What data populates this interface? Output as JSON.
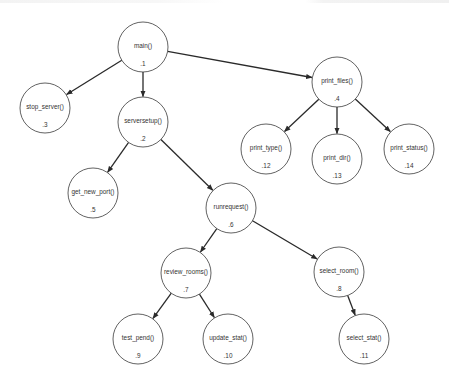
{
  "diagram": {
    "type": "call-tree",
    "node_radius": 25,
    "colors": {
      "background": "#ffffff",
      "node_stroke": "#3a3a3a",
      "edge": "#2a2a2a",
      "text": "#333333"
    },
    "nodes": [
      {
        "key": "n1",
        "label": "main()",
        "id": ".1",
        "cx": 143,
        "cy": 47
      },
      {
        "key": "n2",
        "label": "serversetup()",
        "id": ".2",
        "cx": 143,
        "cy": 122
      },
      {
        "key": "n3",
        "label": "stop_server()",
        "id": ".3",
        "cx": 45,
        "cy": 108
      },
      {
        "key": "n4",
        "label": "print_files()",
        "id": ".4",
        "cx": 337,
        "cy": 82
      },
      {
        "key": "n5",
        "label": "get_new_port()",
        "id": ".5",
        "cx": 93,
        "cy": 193
      },
      {
        "key": "n6",
        "label": "runrequest()",
        "id": ".6",
        "cx": 231,
        "cy": 208
      },
      {
        "key": "n7",
        "label": "review_rooms()",
        "id": ".7",
        "cx": 186,
        "cy": 273
      },
      {
        "key": "n8",
        "label": "select_room()",
        "id": ".8",
        "cx": 339,
        "cy": 272
      },
      {
        "key": "n9",
        "label": "test_pend()",
        "id": ".9",
        "cx": 138,
        "cy": 339
      },
      {
        "key": "n10",
        "label": "update_stat()",
        "id": ".10",
        "cx": 228,
        "cy": 339
      },
      {
        "key": "n11",
        "label": "select_stat()",
        "id": ".11",
        "cx": 364,
        "cy": 339
      },
      {
        "key": "n12",
        "label": "print_type()",
        "id": ".12",
        "cx": 266,
        "cy": 149
      },
      {
        "key": "n13",
        "label": "print_dir()",
        "id": ".13",
        "cx": 337,
        "cy": 159
      },
      {
        "key": "n14",
        "label": "print_status()",
        "id": ".14",
        "cx": 409,
        "cy": 149
      }
    ],
    "edges": [
      {
        "from": "n1",
        "to": "n3"
      },
      {
        "from": "n1",
        "to": "n2"
      },
      {
        "from": "n1",
        "to": "n4"
      },
      {
        "from": "n2",
        "to": "n5"
      },
      {
        "from": "n2",
        "to": "n6"
      },
      {
        "from": "n4",
        "to": "n12"
      },
      {
        "from": "n4",
        "to": "n13"
      },
      {
        "from": "n4",
        "to": "n14"
      },
      {
        "from": "n6",
        "to": "n7"
      },
      {
        "from": "n6",
        "to": "n8"
      },
      {
        "from": "n7",
        "to": "n9"
      },
      {
        "from": "n7",
        "to": "n10"
      },
      {
        "from": "n8",
        "to": "n11"
      }
    ]
  }
}
